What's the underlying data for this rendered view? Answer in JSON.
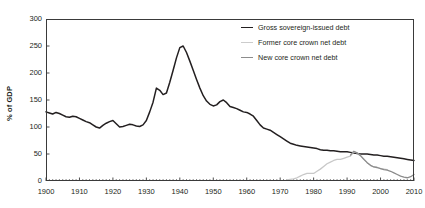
{
  "chart_data": {
    "type": "line",
    "title": "",
    "xlabel": "",
    "ylabel": "% of GDP",
    "xlim": [
      1900,
      2010
    ],
    "ylim": [
      0,
      300
    ],
    "yticks": [
      0,
      50,
      100,
      150,
      200,
      250,
      300
    ],
    "xticks": [
      1900,
      1910,
      1920,
      1930,
      1940,
      1950,
      1960,
      1970,
      1980,
      1990,
      2000,
      2010
    ],
    "grid": false,
    "legend_position": "top-right-inside",
    "minor_ticks": "annual",
    "series": [
      {
        "name": "Gross sovereign-issued debt",
        "color": "#231f20",
        "width": 1.5,
        "x": [
          1900,
          1901,
          1902,
          1903,
          1904,
          1905,
          1906,
          1907,
          1908,
          1909,
          1910,
          1911,
          1912,
          1913,
          1914,
          1915,
          1916,
          1917,
          1918,
          1919,
          1920,
          1921,
          1922,
          1923,
          1924,
          1925,
          1926,
          1927,
          1928,
          1929,
          1930,
          1931,
          1932,
          1933,
          1934,
          1935,
          1936,
          1937,
          1938,
          1939,
          1940,
          1941,
          1942,
          1943,
          1944,
          1945,
          1946,
          1947,
          1948,
          1949,
          1950,
          1951,
          1952,
          1953,
          1954,
          1955,
          1956,
          1957,
          1958,
          1959,
          1960,
          1961,
          1962,
          1963,
          1964,
          1965,
          1966,
          1967,
          1968,
          1969,
          1970,
          1971,
          1972,
          1973,
          1974,
          1975,
          1976,
          1977,
          1978,
          1979,
          1980,
          1981,
          1982,
          1983,
          1984,
          1985,
          1986,
          1987,
          1988,
          1989,
          1990,
          1991,
          1992,
          1993,
          1994,
          1995,
          1996,
          1997,
          1998,
          1999,
          2000,
          2001,
          2002,
          2003,
          2004,
          2005,
          2006,
          2007,
          2008,
          2009,
          2010
        ],
        "values": [
          128,
          126,
          124,
          127,
          125,
          122,
          119,
          118,
          120,
          119,
          116,
          113,
          110,
          108,
          104,
          100,
          98,
          103,
          107,
          110,
          112,
          106,
          100,
          101,
          103,
          105,
          104,
          102,
          101,
          104,
          112,
          128,
          146,
          172,
          168,
          160,
          163,
          183,
          205,
          228,
          247,
          250,
          238,
          222,
          205,
          188,
          172,
          158,
          148,
          142,
          139,
          141,
          147,
          150,
          145,
          138,
          136,
          134,
          131,
          128,
          127,
          124,
          120,
          112,
          104,
          98,
          96,
          94,
          90,
          86,
          82,
          78,
          74,
          70,
          68,
          66,
          65,
          64,
          63,
          62,
          61,
          60,
          58,
          57,
          57,
          56,
          56,
          55,
          54,
          54,
          54,
          53,
          52,
          51,
          50,
          50,
          50,
          49,
          48,
          48,
          47,
          46,
          46,
          45,
          44,
          43,
          42,
          41,
          40,
          39,
          38
        ],
        "values_note": "Percent of GDP; peak 250 in 1933"
      },
      {
        "name": "Former core crown net debt",
        "color": "#c8c8c8",
        "width": 1.3,
        "x": [
          1972,
          1973,
          1974,
          1975,
          1976,
          1977,
          1978,
          1979,
          1980,
          1981,
          1982,
          1983,
          1984,
          1985,
          1986,
          1987,
          1988,
          1989,
          1990,
          1991,
          1992,
          1993,
          1994,
          1995,
          1996,
          1997,
          1998,
          1999,
          2000,
          2001,
          2002
        ],
        "values": [
          2,
          3,
          4,
          6,
          9,
          12,
          14,
          14,
          14,
          18,
          22,
          27,
          32,
          35,
          38,
          40,
          40,
          42,
          44,
          46,
          54,
          52,
          47,
          41,
          34,
          29,
          26,
          25,
          23,
          22,
          21
        ]
      },
      {
        "name": "New core crown net debt",
        "color": "#8c8c8c",
        "width": 1.3,
        "x": [
          1991,
          1992,
          1993,
          1994,
          1995,
          1996,
          1997,
          1998,
          1999,
          2000,
          2001,
          2002,
          2003,
          2004,
          2005,
          2006,
          2007,
          2008,
          2009,
          2010
        ],
        "values": [
          48,
          55,
          52,
          47,
          40,
          34,
          29,
          26,
          25,
          23,
          21,
          20,
          18,
          15,
          12,
          9,
          7,
          6,
          8,
          12
        ]
      }
    ]
  },
  "legend": {
    "items": [
      {
        "label": "Gross sovereign-issued debt",
        "color": "#231f20",
        "width": "1.6px"
      },
      {
        "label": "Former core crown net debt",
        "color": "#cccccc",
        "width": "1.4px"
      },
      {
        "label": "New core crown net debt",
        "color": "#8c8c8c",
        "width": "1.4px"
      }
    ]
  },
  "axes": {
    "y_title": "% of GDP",
    "y_tick_labels": [
      "300",
      "250",
      "200",
      "150",
      "100",
      "50",
      "0"
    ],
    "x_tick_labels": [
      "1900",
      "1910",
      "1920",
      "1930",
      "1940",
      "1950",
      "1960",
      "1970",
      "1980",
      "1990",
      "2000",
      "2010"
    ]
  }
}
